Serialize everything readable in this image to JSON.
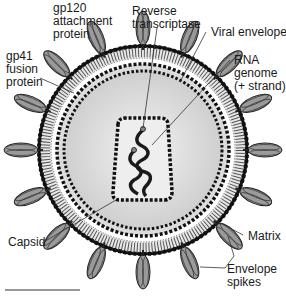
{
  "diagram": {
    "labels": {
      "gp120": "gp120\nattachment\nprotein",
      "gp41": "gp41\nfusion\nprotein",
      "reverse_transcriptase": "Reverse\ntranscriptase",
      "viral_envelope": "Viral envelope",
      "rna_genome": "RNA\ngenome\n(+ strand)",
      "capsid": "Capsid",
      "matrix": "Matrix",
      "envelope_spikes": "Envelope\nspikes"
    },
    "colors": {
      "spike_fill": "#8a8a8a",
      "membrane_dark": "#1a1a1a",
      "matrix_fill": "#cfcfcf",
      "capsid_fill": "#d9d9d9",
      "core_fill": "#ececec",
      "rna": "#222222"
    }
  }
}
